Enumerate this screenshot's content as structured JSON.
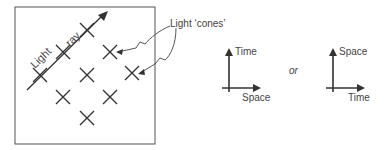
{
  "diagram": {
    "ray_label_1": "Light",
    "ray_label_2": "ray",
    "callout": "Light ‘cones’",
    "axes_left": {
      "y_label": "Time",
      "x_label": "Space"
    },
    "connector": "or",
    "axes_right": {
      "y_label": "Space",
      "x_label": "Time"
    }
  },
  "colors": {
    "stroke": "#333333"
  }
}
